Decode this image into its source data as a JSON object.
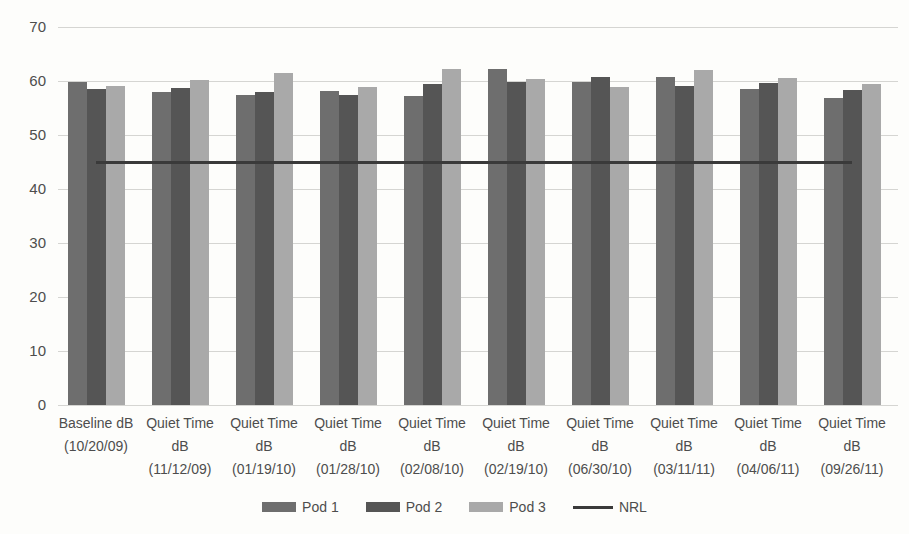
{
  "chart_data": {
    "type": "bar",
    "title": "",
    "xlabel": "",
    "ylabel": "",
    "ylim": [
      0,
      70
    ],
    "ytick_step": 10,
    "grid": "horizontal",
    "legend_position": "bottom",
    "categories": [
      "Baseline dB\n(10/20/09)",
      "Quiet Time\ndB\n(11/12/09)",
      "Quiet Time\ndB\n(01/19/10)",
      "Quiet Time\ndB\n(01/28/10)",
      "Quiet Time\ndB\n(02/08/10)",
      "Quiet Time\ndB\n(02/19/10)",
      "Quiet Time\ndB\n(06/30/10)",
      "Quiet Time\ndB\n(03/11/11)",
      "Quiet Time\ndB\n(04/06/11)",
      "Quiet Time\ndB\n(09/26/11)"
    ],
    "series": [
      {
        "name": "Pod 1",
        "color_key": "pod1",
        "values": [
          59.8,
          57.9,
          57.4,
          58.1,
          57.3,
          62.2,
          59.9,
          60.8,
          58.6,
          56.8
        ]
      },
      {
        "name": "Pod 2",
        "color_key": "pod2",
        "values": [
          58.5,
          58.7,
          57.9,
          57.5,
          59.5,
          59.9,
          60.7,
          59.1,
          59.7,
          58.3
        ]
      },
      {
        "name": "Pod 3",
        "color_key": "pod3",
        "values": [
          59.1,
          60.2,
          61.5,
          58.8,
          62.2,
          60.3,
          58.9,
          62.0,
          60.5,
          59.5
        ]
      }
    ],
    "line_series": {
      "name": "NRL",
      "value": 45,
      "color_key": "nrl"
    },
    "legend": [
      "Pod 1",
      "Pod 2",
      "Pod 3",
      "NRL"
    ]
  },
  "colors": {
    "pod1": "#6e6e6e",
    "pod2": "#555555",
    "pod3": "#a9a9a9",
    "nrl": "#3a3a3a",
    "gridline": "#d5d5d2",
    "axis_text": "#4d4d4d",
    "background": "#fdfdfb"
  }
}
